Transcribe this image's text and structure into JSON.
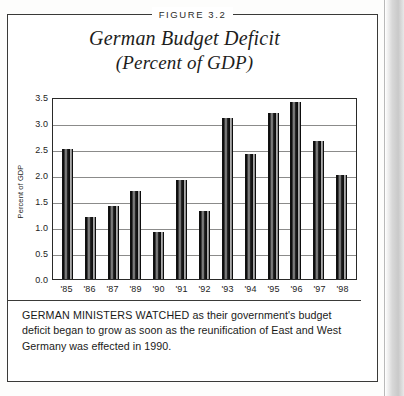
{
  "figure": {
    "label": "FIGURE 3.2"
  },
  "chart_data": {
    "type": "bar",
    "title": "German Budget Deficit",
    "subtitle": "(Percent of GDP)",
    "title_line1": "German Budget Deficit",
    "title_line2": "(Percent of GDP)",
    "xlabel": "",
    "ylabel": "Percent of GDP",
    "ylim": [
      0.0,
      3.5
    ],
    "ytick_step": 0.5,
    "grid": true,
    "legend": "none",
    "categories": [
      "'85",
      "'86",
      "'87",
      "'89",
      "'90",
      "'91",
      "'92",
      "'93",
      "'94",
      "'95",
      "'96",
      "'97",
      "'98"
    ],
    "values": [
      2.5,
      1.2,
      1.4,
      1.7,
      0.9,
      1.9,
      1.3,
      3.1,
      2.4,
      3.2,
      3.4,
      2.65,
      2.0
    ],
    "ytick_labels": [
      "3.5",
      "3.0",
      "2.5",
      "2.0",
      "1.5",
      "1.0",
      "0.5",
      "0.0"
    ],
    "ytick_values": [
      3.5,
      3.0,
      2.5,
      2.0,
      1.5,
      1.0,
      0.5,
      0.0
    ]
  },
  "caption": {
    "lead": "GERMAN MINISTERS WATCHED",
    "rest": " as their government's budget deficit began to grow as soon as the reunification of East and West Germany was effected in 1990.",
    "full": "GERMAN MINISTERS WATCHED as their government's budget deficit began to grow as soon as the reunification of East and West Germany was effected in 1990."
  },
  "colors": {
    "frame": "#3a3a38",
    "bar_dark": "#0d0d0d",
    "bar_highlight": "#9a9a9a",
    "gridline": "#8b8b8a",
    "text": "#1d1d1c",
    "page": "#ffffff"
  }
}
